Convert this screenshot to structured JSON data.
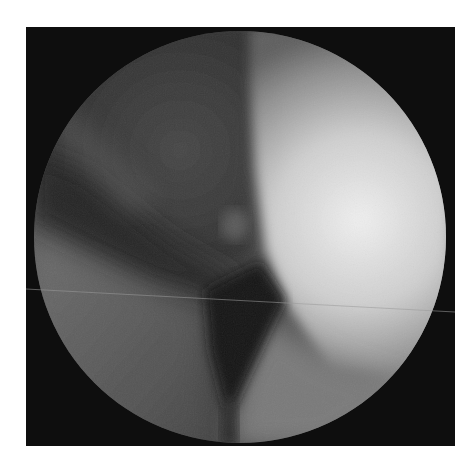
{
  "image": {
    "description": "Grayscale endoscopic/arthroscopic circular view on black square background",
    "colors": {
      "page_background": "#ffffff",
      "frame_background": "#0e0e0e",
      "dark_tissue": "#2a2a2a",
      "mid_tissue": "#5a5a5a",
      "bright_tissue": "#e4e4e4",
      "shadow_cavity": "#141414"
    },
    "frame": {
      "x": 26,
      "y": 27,
      "width": 429,
      "height": 419
    },
    "viewport_circle": {
      "cx": 240,
      "cy": 237,
      "r": 206
    }
  }
}
